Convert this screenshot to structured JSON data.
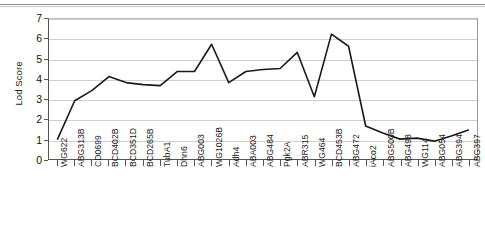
{
  "chart_data": {
    "type": "line",
    "title": "",
    "xlabel": "",
    "ylabel": "Lod Score",
    "ylim": [
      0,
      7
    ],
    "yticks": [
      0,
      1,
      2,
      3,
      4,
      5,
      6,
      7
    ],
    "grid": true,
    "legend": "none",
    "line_color": "#1a1a1a",
    "categories": [
      "WG622",
      "ABG313B",
      "CD0699",
      "BCD402B",
      "BCD351D",
      "BCD265B",
      "TubA1",
      "Dhn6",
      "ABG003",
      "WG1026B",
      "Adh4",
      "ABA003",
      "ABG484",
      "Pgk2A",
      "ABR315",
      "WG464",
      "BCD453B",
      "ABG472",
      "iAco2",
      "ABG500B",
      "ABG498",
      "WG114",
      "ABG054",
      "ABG394",
      "ABG397"
    ],
    "values": [
      1.05,
      2.95,
      3.45,
      4.15,
      3.85,
      3.75,
      3.7,
      4.4,
      4.4,
      5.75,
      3.85,
      4.4,
      4.5,
      4.55,
      5.35,
      3.15,
      6.25,
      5.65,
      1.7,
      1.35,
      1.05,
      1.1,
      0.95,
      1.2,
      1.5
    ]
  },
  "yaxis": {
    "title": "Lod Score",
    "ticks": [
      "0",
      "1",
      "2",
      "3",
      "4",
      "5",
      "6",
      "7"
    ]
  }
}
